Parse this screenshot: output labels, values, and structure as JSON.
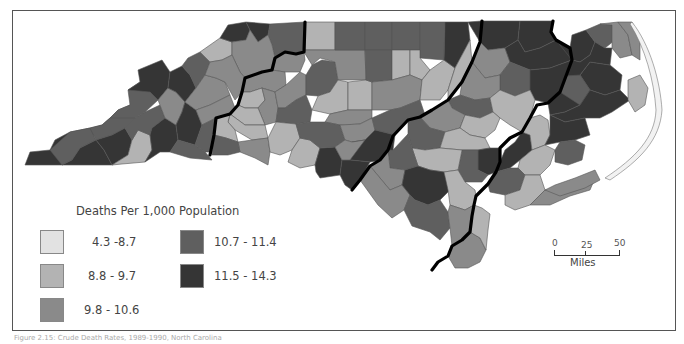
{
  "map": {
    "subject": "North Carolina counties",
    "classes": [
      {
        "label": "4.3 -8.7",
        "min": 4.3,
        "max": 8.7,
        "color": "#e2e2e2"
      },
      {
        "label": "8.8 - 9.7",
        "min": 8.8,
        "max": 9.7,
        "color": "#b3b3b3"
      },
      {
        "label": "9.8 - 10.6",
        "min": 9.8,
        "max": 10.6,
        "color": "#8a8a8a"
      },
      {
        "label": "10.7 - 11.4",
        "min": 10.7,
        "max": 11.4,
        "color": "#5f5f5f"
      },
      {
        "label": "11.5 - 14.3",
        "min": 11.5,
        "max": 14.3,
        "color": "#353535"
      }
    ]
  },
  "legend": {
    "title": "Deaths Per 1,000 Population"
  },
  "scale_bar": {
    "ticks": [
      "0",
      "25",
      "50"
    ],
    "unit": "Miles"
  },
  "caption": "Figure 2.15: Crude Death Rates, 1989-1990, North Carolina"
}
